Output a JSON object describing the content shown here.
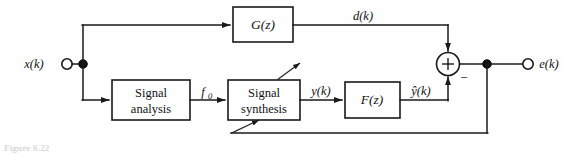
{
  "figure": {
    "domain": "block-diagram",
    "caption": "Figure 6.22",
    "background_color": "#fefefe",
    "line_color": "#1a1a1a"
  },
  "blocks": [
    {
      "id": "g",
      "label": "G(z)",
      "kind": "transfer-function"
    },
    {
      "id": "signal_analysis",
      "line1": "Signal",
      "line2": "analysis",
      "kind": "process"
    },
    {
      "id": "signal_synthesis",
      "line1": "Signal",
      "line2": "synthesis",
      "kind": "process"
    },
    {
      "id": "f",
      "label": "F(z)",
      "kind": "transfer-function"
    }
  ],
  "signals": {
    "input": "x(k)",
    "top_path": "d(k)",
    "analysis_out": "f",
    "analysis_out_sub": "0",
    "synthesis_out": "y(k)",
    "filter_out": "ŷ(k)",
    "output": "e(k)"
  },
  "summing_junction": {
    "plus_sign": "+",
    "negative_input_sign": "−"
  }
}
